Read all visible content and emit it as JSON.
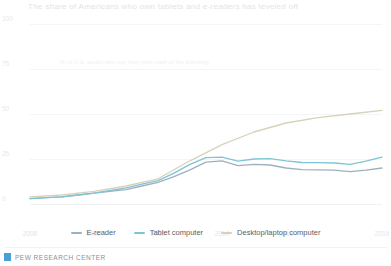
{
  "chart_data": {
    "type": "line",
    "title": "The share of Americans who own tablets and e-readers has leveled off",
    "xlabel": "",
    "ylabel": "",
    "ylim": [
      0,
      100
    ],
    "xlim": [
      2008,
      2019
    ],
    "grid": true,
    "legend_position": "bottom-center",
    "ytick_labels": [
      "100",
      "75",
      "50",
      "25",
      "0"
    ],
    "ytick_values": [
      100,
      75,
      50,
      25,
      0
    ],
    "xtick_labels": [
      "2008",
      "2010",
      "2012",
      "2014",
      "2016",
      "2019"
    ],
    "xtick_values": [
      2008,
      2010,
      2012,
      2014,
      2016,
      2019
    ],
    "annotation": "% of U.S. adults who say they own each of the following",
    "series": [
      {
        "name": "Desktop/laptop computer",
        "color": "#d8d2b8",
        "x": [
          2008,
          2009,
          2010,
          2011,
          2012,
          2013,
          2014,
          2015,
          2016,
          2017,
          2018,
          2019
        ],
        "values": [
          4,
          5,
          7,
          10,
          14,
          24,
          33,
          40,
          45,
          48,
          50,
          52
        ]
      },
      {
        "name": "Tablet computer",
        "color": "#7fc4d8",
        "x": [
          2008,
          2009,
          2010,
          2011,
          2012,
          2013,
          2014,
          2015,
          2016,
          2017,
          2018,
          2019
        ],
        "values": [
          3,
          4,
          6,
          9,
          13,
          22,
          26,
          25,
          24,
          23,
          22,
          26
        ]
      },
      {
        "name": "E-reader",
        "color": "#9fb0bd",
        "x": [
          2008,
          2009,
          2010,
          2011,
          2012,
          2013,
          2014,
          2015,
          2016,
          2017,
          2018,
          2019
        ],
        "values": [
          3,
          4,
          6,
          8,
          12,
          19,
          24,
          22,
          20,
          19,
          18,
          20
        ]
      }
    ]
  },
  "footer": {
    "source": "PEW RESEARCH CENTER"
  }
}
